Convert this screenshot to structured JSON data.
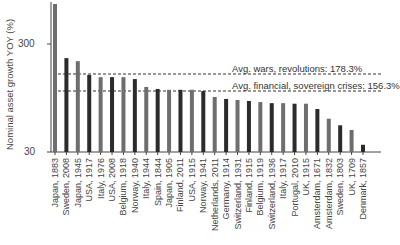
{
  "chart_data": {
    "type": "bar",
    "title": "",
    "xlabel": "",
    "ylabel": "Nominal asset growth YOY (%)",
    "yscale": "log",
    "ylim": [
      30,
      700
    ],
    "yticks": [
      30,
      300
    ],
    "grid": false,
    "categories": [
      "Japan, 1883",
      "Sweden, 2008",
      "Japan, 1945",
      "USA, 1917",
      "Italy, 1976",
      "USA, 2008",
      "Belgium, 1918",
      "Norway, 1940",
      "Italy, 1944",
      "Spain, 1844",
      "Japan, 1905",
      "Finland, 2011",
      "USA, 1915",
      "Norway, 1941",
      "Netherlands, 2011",
      "Germany, 1914",
      "Switzerland, 1931",
      "Finland, 1915",
      "Belgium, 1919",
      "Switzerland, 1936",
      "Italy, 1917",
      "Portugal, 2010",
      "UK, 1915",
      "Amsterdam, 1671",
      "Amsterdam, 1832",
      "Sweden, 1803",
      "UK, 1709",
      "Denmark, 1857"
    ],
    "values": [
      704,
      222,
      208,
      155,
      148,
      148,
      148,
      142,
      120,
      115,
      113,
      113,
      113,
      110,
      97,
      93,
      91,
      89,
      87,
      85,
      85,
      84,
      84,
      75,
      61,
      53,
      48,
      35
    ],
    "bar_colors": [
      "#6e6e6e",
      "#2b2b2b"
    ],
    "annotations": [
      {
        "text": "Avg. wars, revolutions: 178.3%",
        "value": 178.3,
        "style": "dashed"
      },
      {
        "text": "Avg. financial, sovereign crises: 156.3%",
        "value": 156.3,
        "style": "dashed"
      }
    ]
  }
}
